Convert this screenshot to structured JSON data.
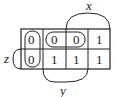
{
  "kmap": {
    "rows": [
      [
        "0",
        "0",
        "0",
        "1"
      ],
      [
        "0",
        "1",
        "1",
        "1"
      ]
    ],
    "labels": {
      "x": "x",
      "y": "y",
      "z": "z"
    },
    "loops": [
      {
        "name": "loop-column-1",
        "cells": [
          [
            0,
            0
          ],
          [
            1,
            0
          ]
        ]
      },
      {
        "name": "loop-row-1-cols-2-3",
        "cells": [
          [
            0,
            1
          ],
          [
            0,
            2
          ]
        ]
      }
    ]
  }
}
